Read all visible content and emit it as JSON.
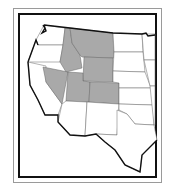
{
  "map": {
    "title": "Western United States - Mountain States",
    "region_label": "Mountain region",
    "highlight_color": "#a9a9a9",
    "base_color": "#ffffff",
    "border_color": "#111111",
    "highlighted_states": [
      "Montana",
      "Idaho",
      "Wyoming",
      "Nevada",
      "Utah",
      "Colorado"
    ],
    "other_states": [
      "Washington",
      "Oregon",
      "California",
      "Arizona",
      "New Mexico",
      "North Dakota",
      "South Dakota",
      "Nebraska",
      "Kansas",
      "Oklahoma",
      "Texas",
      "Minnesota",
      "Iowa",
      "Missouri"
    ]
  }
}
